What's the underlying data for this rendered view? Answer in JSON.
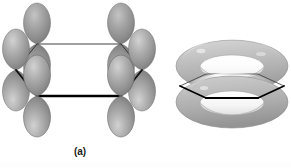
{
  "figure": {
    "background_color": "#ffffff",
    "width": 291,
    "height": 168
  },
  "panels": [
    {
      "id": "a",
      "caption": "(a)",
      "description": "Six parallel p orbitals on the carbon atoms of the benzene ring",
      "ring": {
        "shape": "hexagon",
        "vertices": 6,
        "center_x": 79,
        "center_y": 70,
        "radius_x": 42,
        "radius_y": 26,
        "front_edge_color": "#000000",
        "front_edge_width": 2.4,
        "back_edge_color": "#2b2b2b",
        "back_edge_width": 0.9
      },
      "orbitals": {
        "count": 6,
        "lobes_per_orbital": 2,
        "total_lobes": 12,
        "shape": "teardrop",
        "fill_color": "#9a9a9a",
        "highlight_color": "#c9c9c9",
        "shadow_color": "#6f6f6f",
        "outline_color": "#6a6a6a"
      }
    },
    {
      "id": "b",
      "caption": "(b)",
      "description": "The resulting delocalized pi electron cloud, shown as two rings above and below the ring plane",
      "ring": {
        "shape": "hexagon",
        "vertices": 6,
        "center_x": 72,
        "center_y": 86,
        "radius_x": 52,
        "radius_y": 24,
        "front_edge_color": "#000000",
        "front_edge_width": 2.2,
        "back_edge_color": "#3a3a3a",
        "back_edge_width": 0.8,
        "clipped_right": true
      },
      "tori": {
        "count": 2,
        "positions": [
          "above-plane",
          "below-plane"
        ],
        "fill_color": "#c2c2c2",
        "highlight_color": "#e6e6e6",
        "shadow_color": "#8f8f8f",
        "outline_color": "#8a8a8a",
        "clipped_right": true
      }
    }
  ],
  "colors": {
    "background": "#ffffff",
    "caption_text": "#1c1c1c",
    "bond_dark": "#000000",
    "bond_light": "#2b2b2b",
    "orbital_mid": "#9a9a9a",
    "orbital_light": "#c9c9c9",
    "orbital_dark": "#6f6f6f",
    "torus_mid": "#c2c2c2",
    "torus_light": "#e6e6e6",
    "torus_dark": "#8f8f8f"
  }
}
